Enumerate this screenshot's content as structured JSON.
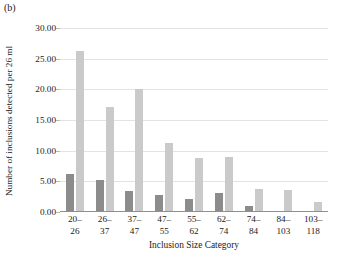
{
  "panel": {
    "label": "(b)"
  },
  "chart_data": {
    "type": "bar",
    "title": "",
    "subtitle": "",
    "panel_label": "(b)",
    "xlabel": "Inclusion Size Category",
    "ylabel": "Number of inclusions detected per 26 ml",
    "categories": [
      "20–26",
      "26–37",
      "37–47",
      "47–55",
      "55–62",
      "62–74",
      "74–84",
      "84–103",
      "103–118"
    ],
    "category_lines": [
      [
        "20–",
        "26"
      ],
      [
        "26–",
        "37"
      ],
      [
        "37–",
        "47"
      ],
      [
        "47–",
        "55"
      ],
      [
        "55–",
        "62"
      ],
      [
        "62–",
        "74"
      ],
      [
        "74–",
        "84"
      ],
      [
        "84–",
        "103"
      ],
      [
        "103–",
        "118"
      ]
    ],
    "series": [
      {
        "name": "series-1",
        "color": "#8c8c8c",
        "values": [
          6.2,
          5.2,
          3.4,
          2.8,
          2.1,
          3.1,
          1.0,
          0.2,
          0.0
        ]
      },
      {
        "name": "series-2",
        "color": "#cacaca",
        "values": [
          26.3,
          17.2,
          20.1,
          11.3,
          8.8,
          8.9,
          3.8,
          3.6,
          1.7
        ]
      }
    ],
    "ylim": [
      0,
      30
    ],
    "ytick_values": [
      0,
      5,
      10,
      15,
      20,
      25,
      30
    ],
    "ytick_labels": [
      "0.00",
      "5.00",
      "10.00",
      "15.00",
      "20.00",
      "25.00",
      "30.00"
    ],
    "grid": true,
    "grid_axis": "y",
    "legend": "none",
    "legend_position": "none",
    "gridline_color": "#e3e3e3",
    "axis_color": "#8f8f8f"
  }
}
